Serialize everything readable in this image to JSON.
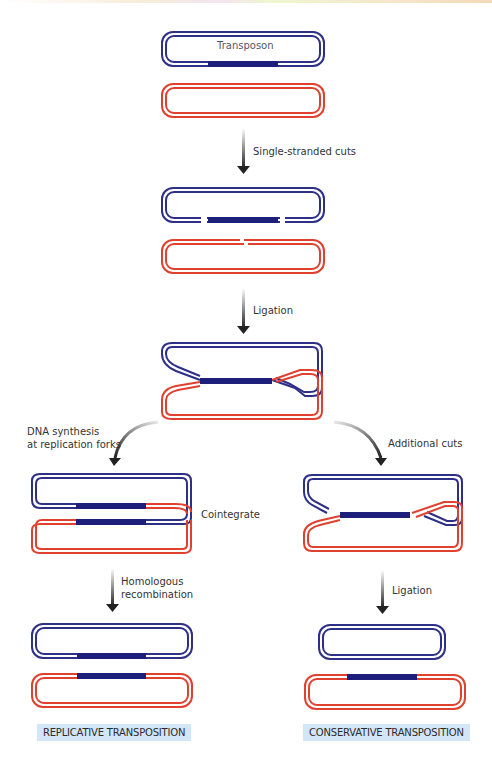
{
  "diagram": {
    "title_label": "Transposon",
    "colors": {
      "donor": "#2e2f86",
      "target": "#e0412f",
      "transposon": "#1d1f7a",
      "arrow": "#333333",
      "result_bg": "#d3e6f7"
    },
    "steps": {
      "step1": "Single-stranded cuts",
      "step2": "Ligation",
      "left_branch": "DNA synthesis\nat replication forks",
      "left_branch_line1": "DNA synthesis",
      "left_branch_line2": "at replication forks",
      "right_branch": "Additional cuts",
      "cointegrate": "Cointegrate",
      "left_final_line1": "Homologous",
      "left_final_line2": "recombination",
      "right_final": "Ligation"
    },
    "results": {
      "left": "REPLICATIVE TRANSPOSITION",
      "right": "CONSERVATIVE TRANSPOSITION"
    },
    "caption_fragment": "A model for the ..."
  }
}
